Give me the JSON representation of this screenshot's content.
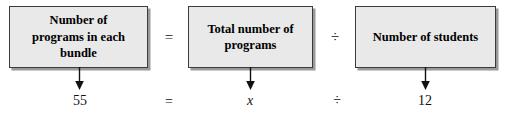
{
  "diagram": {
    "type": "equation-flow",
    "boxes": [
      {
        "id": "bundle",
        "label": "Number of\nprograms in each\nbundle",
        "value": "55"
      },
      {
        "id": "total",
        "label": "Total number of\nprograms",
        "value": "x"
      },
      {
        "id": "students",
        "label": "Number of students",
        "value": "12"
      }
    ],
    "operators": {
      "equals": "=",
      "divide": "÷"
    },
    "arrows": [
      {
        "id": "arrow-bundle",
        "icon": "down-arrow-icon"
      },
      {
        "id": "arrow-total",
        "icon": "down-arrow-icon"
      },
      {
        "id": "arrow-students",
        "icon": "down-arrow-icon"
      }
    ],
    "colors": {
      "box_fill": "#e9e9e9",
      "box_border": "#3b3b3b",
      "box_shadow": "#9a9a9a",
      "text": "#000000",
      "background": "#ffffff"
    }
  }
}
